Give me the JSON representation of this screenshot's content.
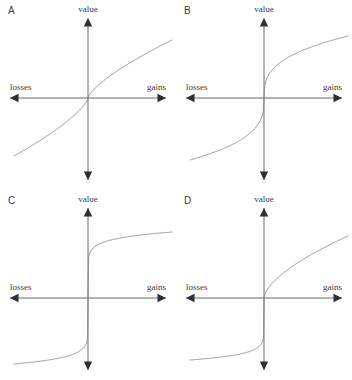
{
  "figure": {
    "background": "#ffffff",
    "axis_color": "#555555",
    "curve_color": "#8a8a8a",
    "text_color": "#3b3b3b"
  },
  "axis_labels": {
    "value": "value",
    "losses": "losses",
    "gains": "gains"
  },
  "panels": [
    {
      "letter": "A",
      "origin_x": 88,
      "origin_y": 98,
      "gain_exp": 0.72,
      "loss_exp": 0.72,
      "loss_scale": 1.0,
      "gain_amp": 58,
      "loss_amp": 58
    },
    {
      "letter": "B",
      "origin_x": 88,
      "origin_y": 98,
      "gain_exp": 0.34,
      "loss_exp": 0.34,
      "loss_scale": 1.0,
      "gain_amp": 62,
      "loss_amp": 62
    },
    {
      "letter": "C",
      "origin_x": 88,
      "origin_y": 108,
      "gain_exp": 0.1,
      "loss_exp": 0.1,
      "loss_scale": 1.0,
      "gain_amp": 66,
      "loss_amp": 66
    },
    {
      "letter": "D",
      "origin_x": 88,
      "origin_y": 108,
      "gain_exp": 0.62,
      "loss_exp": 0.09,
      "loss_scale": 1.0,
      "gain_amp": 62,
      "loss_amp": 62
    }
  ],
  "chart_data": {
    "type": "line",
    "xlabel": "losses ↔ gains",
    "ylabel": "value",
    "grid": false,
    "legend": "none",
    "panel_count": 4,
    "axis_ranges": {
      "x": [
        -1,
        1
      ],
      "y": [
        -1,
        1
      ]
    },
    "series": [
      {
        "name": "A",
        "label": "A",
        "shape": "gentle S-curve, nearly linear tails",
        "steepness": "low",
        "symmetric": true,
        "x": [
          -1.0,
          -0.8,
          -0.6,
          -0.4,
          -0.2,
          -0.1,
          -0.05,
          0,
          0.05,
          0.1,
          0.2,
          0.4,
          0.6,
          0.8,
          1.0
        ],
        "y": [
          -1.0,
          -0.85,
          -0.69,
          -0.52,
          -0.32,
          -0.2,
          -0.13,
          0,
          0.13,
          0.2,
          0.32,
          0.52,
          0.69,
          0.85,
          1.0
        ]
      },
      {
        "name": "B",
        "label": "B",
        "shape": "steep S-curve with pronounced saturation",
        "steepness": "medium-high",
        "symmetric": true,
        "x": [
          -1.0,
          -0.8,
          -0.6,
          -0.4,
          -0.2,
          -0.1,
          -0.05,
          0,
          0.05,
          0.1,
          0.2,
          0.4,
          0.6,
          0.8,
          1.0
        ],
        "y": [
          -1.0,
          -0.93,
          -0.84,
          -0.72,
          -0.57,
          -0.45,
          -0.36,
          0,
          0.36,
          0.45,
          0.57,
          0.72,
          0.84,
          0.93,
          1.0
        ]
      },
      {
        "name": "C",
        "label": "C",
        "shape": "near step function, flat plateaus both sides",
        "steepness": "very high",
        "symmetric": true,
        "x": [
          -1.0,
          -0.8,
          -0.6,
          -0.4,
          -0.2,
          -0.1,
          -0.05,
          0,
          0.05,
          0.1,
          0.2,
          0.4,
          0.6,
          0.8,
          1.0
        ],
        "y": [
          -1.0,
          -0.98,
          -0.95,
          -0.91,
          -0.85,
          -0.79,
          -0.74,
          0,
          0.74,
          0.79,
          0.85,
          0.91,
          0.95,
          0.98,
          1.0
        ]
      },
      {
        "name": "D",
        "label": "D",
        "shape": "asymmetric: gradual concave gains, abrupt saturating losses",
        "steepness": "asymmetric",
        "symmetric": false,
        "x": [
          -1.0,
          -0.8,
          -0.6,
          -0.4,
          -0.2,
          -0.1,
          -0.05,
          0,
          0.05,
          0.1,
          0.2,
          0.4,
          0.6,
          0.8,
          1.0
        ],
        "y": [
          -1.0,
          -0.98,
          -0.96,
          -0.92,
          -0.87,
          -0.81,
          -0.76,
          0,
          0.17,
          0.26,
          0.4,
          0.61,
          0.76,
          0.89,
          1.0
        ]
      }
    ]
  }
}
